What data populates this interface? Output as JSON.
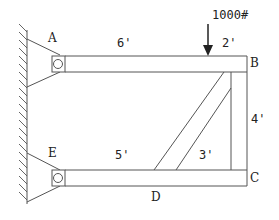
{
  "diagram": {
    "type": "truss/frame statics problem",
    "points": {
      "A": "A",
      "B": "B",
      "C": "C",
      "D": "D",
      "E": "E"
    },
    "dimensions": {
      "top_left": "6'",
      "top_right": "2'",
      "right_vertical": "4'",
      "bottom_left": "5'",
      "bottom_right": "3'"
    },
    "load": {
      "label": "1000#",
      "direction": "down"
    },
    "colors": {
      "line": "#555555",
      "text": "#222222",
      "background": "#ffffff"
    }
  }
}
